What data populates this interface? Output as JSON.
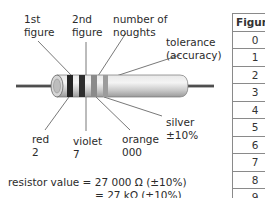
{
  "diagram": {
    "labels": {
      "first_figure": "1st\nfigure",
      "second_figure": "2nd\nfigure",
      "noughts": "number of\nnoughts",
      "tolerance": "tolerance\n(accuracy)",
      "red": "red\n2",
      "violet": "violet\n7",
      "orange": "orange\n000",
      "silver": "silver\n±10%"
    },
    "bands": [
      {
        "name": "red",
        "meaning": "1st figure",
        "value": "2",
        "render_color": "#2a2a2a"
      },
      {
        "name": "violet",
        "meaning": "2nd figure",
        "value": "7",
        "render_color": "#333333"
      },
      {
        "name": "orange",
        "meaning": "number of noughts",
        "value": "000",
        "render_color": "#8c8c8c"
      },
      {
        "name": "silver",
        "meaning": "tolerance",
        "value": "±10%",
        "render_color": "#9a9a9a"
      }
    ],
    "formula": {
      "line1": "resistor value = 27 000 Ω (±10%)",
      "line2": "= 27 kΩ (±10%)"
    }
  },
  "table": {
    "header": "Figure",
    "rows": [
      "0",
      "1",
      "2",
      "3",
      "4",
      "5",
      "6",
      "7",
      "8",
      "9"
    ]
  }
}
